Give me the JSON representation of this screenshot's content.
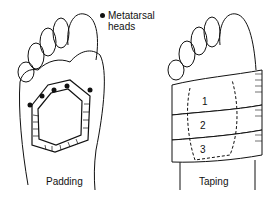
{
  "figure": {
    "legend": {
      "symbol": "filled-dot",
      "label_line1": "Metatarsal",
      "label_line2": "heads"
    },
    "panels": [
      {
        "caption": "Padding",
        "description": "Plantar view of foot with a horseshoe-shaped hatched felt pad surrounding the metatarsal heads"
      },
      {
        "caption": "Taping",
        "description": "Plantar view of foot with three overlapping tape strips over the forefoot pad"
      }
    ],
    "tape_strips": [
      "1",
      "2",
      "3"
    ]
  }
}
